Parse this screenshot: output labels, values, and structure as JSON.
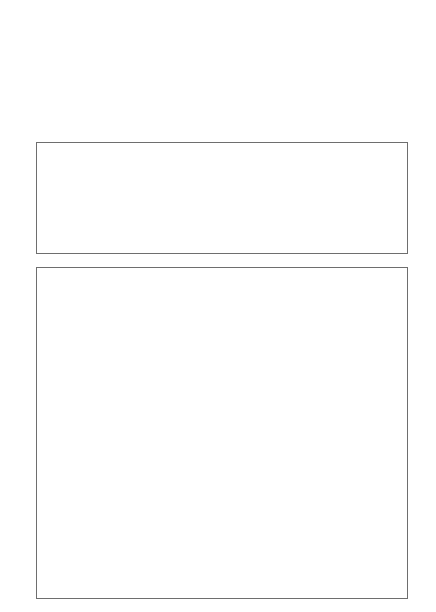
{
  "top_blocks": [
    {
      "x": 7,
      "stripes": [
        "#c4c4c4",
        "#5e5e5e",
        "#c4c4c4",
        "#5e5e5e",
        "#c4c4c4",
        "#5e5e5e",
        "#c4c4c4",
        "#5e5e5e"
      ]
    },
    {
      "x": 80,
      "stripes": [
        "#acacac",
        "#e6e6e6",
        "#acacac",
        "#e6e6e6",
        "#acacac",
        "#e6e6e6",
        "#acacac",
        "#e6e6e6"
      ]
    },
    {
      "x": 153,
      "stripes": [
        "#9e9e9e",
        "#5e5e5e",
        "#9e9e9e",
        "#5e5e5e",
        "#9e9e9e",
        "#5e5e5e",
        "#9e9e9e",
        "#5e5e5e"
      ]
    },
    {
      "x": 226,
      "stripes": [
        "#c8c8c8",
        "#5e5e5e",
        "#c8c8c8",
        "#5e5e5e",
        "#c8c8c8",
        "#5e5e5e",
        "#c8c8c8",
        "#5e5e5e"
      ]
    },
    {
      "x": 300,
      "stripes": [
        "#acacac",
        "#e4e4e4",
        "#acacac",
        "#e4e4e4",
        "#acacac",
        "#e4e4e4",
        "#acacac",
        "#e4e4e4"
      ]
    },
    {
      "x": 373,
      "stripes": [
        "#a4a4a4",
        "#cccccc",
        "#a4a4a4",
        "#cccccc",
        "#a4a4a4",
        "#cccccc",
        "#a4a4a4",
        "#cccccc"
      ]
    }
  ],
  "middle_grid": {
    "columns": [
      [
        "#c0c0c0",
        "#e0e0e0"
      ],
      [
        "#e8e8e8",
        "#5e5e5e"
      ],
      [
        "#c4c4c4",
        "#5e5e5e"
      ],
      [
        "#e0e0e0",
        "#acacac"
      ],
      [
        "#9e9e9e",
        "#5a5a5a"
      ],
      [
        "#d0d0d0",
        "#5c5c5c"
      ]
    ]
  },
  "bottom_grid": {
    "sections": [
      [
        [
          "#a6a6a6",
          "#5e5e5e"
        ],
        [
          "#5e5e5e",
          "#c4c4c4"
        ],
        [
          "#e4e4e4",
          "#c8c8c8"
        ],
        [
          "#5e5e5e",
          "#e8e8e8"
        ],
        [
          "#c0c0c0",
          "#5e5e5e"
        ],
        [
          "#f0f0f0",
          "#e0e0e0"
        ]
      ],
      [
        [
          "#c4c4c4",
          "#5e5e5e"
        ],
        [
          "#a8a8a8",
          "#e4e4e4"
        ],
        [
          "#a4a4a4",
          "#5e5e5e"
        ],
        [
          "#c4c4c4",
          "#5e5e5e"
        ],
        [
          "#acacac",
          "#e4e4e4"
        ],
        [
          "#eeeeee",
          "#5e5e5e"
        ]
      ],
      [
        [
          "#c8c8c8",
          "#a6a6a6"
        ],
        [
          "#eeeeee",
          "#5e5e5e"
        ],
        [
          "#c8c8c8",
          "#5e5e5e"
        ],
        [
          "#e4e4e4",
          "#c4c4c4"
        ],
        [
          "#a6a6a6",
          "#c8c8c8"
        ],
        [
          "#5e5e5e",
          "#c4c4c4"
        ]
      ]
    ]
  }
}
